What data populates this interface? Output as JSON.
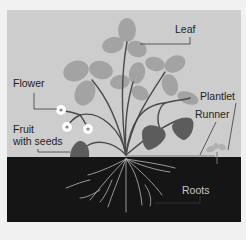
{
  "diagram": {
    "type": "labeled-illustration",
    "labels": {
      "leaf": "Leaf",
      "flower": "Flower",
      "fruit_line1": "Fruit",
      "fruit_line2": "with seeds",
      "plantlet": "Plantlet",
      "runner": "Runner",
      "roots": "Roots"
    },
    "colors": {
      "background": "#f1f1f1",
      "sky": "#cdcdcd",
      "soil": "#151515",
      "leaf": "#a3a3a3",
      "stem": "#4a4a4a",
      "fruit": "#5c5c5c",
      "flower": "#ffffff",
      "root": "#a8a8a8",
      "label_text": "#1e1e1e",
      "label_text_on_soil": "#c8c8c8",
      "leader_line": "#3a3a3a"
    }
  }
}
